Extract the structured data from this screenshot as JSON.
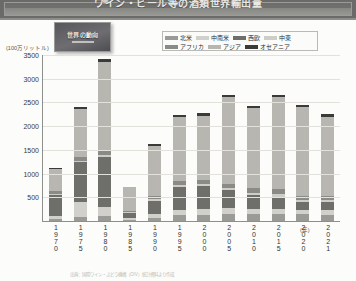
{
  "banner": {
    "title": "ワイン・ビール等の酒類世界輸出量",
    "bullet_icon": "bullet-circle-icon"
  },
  "inset": {
    "label": "世界の動向",
    "rule": ""
  },
  "axis": {
    "y_unit": "(100万リットル)",
    "x_unit": "(年)"
  },
  "source": "出典：国際ワイン・ぶどう機構（OIV）統計資料より作成",
  "chart_data": {
    "type": "bar",
    "title": "ワイン・ビール等の酒類世界輸出量",
    "xlabel": "(年)",
    "ylabel": "(100万リットル)",
    "ylim": [
      0,
      3500
    ],
    "yticks": [
      0,
      500,
      1000,
      1500,
      2000,
      2500,
      3000,
      3500
    ],
    "grid": true,
    "stacked": true,
    "legend_position": "top-right",
    "categories": [
      "1970",
      "1975",
      "1980",
      "1985",
      "1990",
      "1995",
      "2000",
      "2005",
      "2010",
      "2015",
      "2020",
      "2021"
    ],
    "series": [
      {
        "name": "北米",
        "color": "#9a9a96",
        "values": [
          40,
          90,
          95,
          25,
          70,
          120,
          130,
          150,
          140,
          150,
          140,
          130
        ]
      },
      {
        "name": "中南米",
        "color": "#d2d0cb",
        "values": [
          60,
          310,
          200,
          40,
          80,
          110,
          120,
          130,
          120,
          110,
          100,
          95
        ]
      },
      {
        "name": "西欧",
        "color": "#6e6e6a",
        "values": [
          440,
          830,
          1050,
          110,
          280,
          480,
          480,
          360,
          280,
          250,
          150,
          170
        ]
      },
      {
        "name": "中東",
        "color": "#cfcdc8",
        "values": [
          25,
          35,
          40,
          10,
          30,
          40,
          40,
          45,
          50,
          50,
          45,
          40
        ]
      },
      {
        "name": "アフリカ",
        "color": "#8a8a86",
        "values": [
          55,
          75,
          85,
          20,
          60,
          80,
          90,
          100,
          100,
          110,
          95,
          90
        ]
      },
      {
        "name": "アジア",
        "color": "#b8b6b1",
        "values": [
          470,
          1010,
          1870,
          500,
          1060,
          1350,
          1350,
          1810,
          1680,
          1920,
          1860,
          1660
        ]
      },
      {
        "name": "オセアニア",
        "color": "#3a3a38",
        "values": [
          30,
          50,
          60,
          15,
          40,
          50,
          50,
          55,
          50,
          50,
          50,
          55
        ]
      }
    ],
    "totals": [
      1120,
      2400,
      3400,
      720,
      1620,
      2230,
      2260,
      2650,
      2420,
      2640,
      2440,
      2240
    ]
  }
}
